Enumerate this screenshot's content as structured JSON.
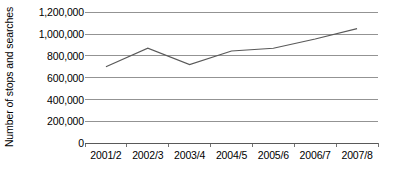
{
  "chart_data": {
    "type": "line",
    "title": "",
    "subtitle": "",
    "xlabel": "",
    "ylabel": "Number of stops and searches",
    "categories": [
      "2001/2",
      "2002/3",
      "2003/4",
      "2004/5",
      "2005/6",
      "2006/7",
      "2007/8"
    ],
    "series": [
      {
        "name": "Number of stops and searches",
        "values": [
          700000,
          870000,
          720000,
          845000,
          870000,
          955000,
          1050000
        ]
      }
    ],
    "ylim": [
      0,
      1200000
    ],
    "y_ticks": [
      0,
      200000,
      400000,
      600000,
      800000,
      1000000,
      1200000
    ],
    "y_tick_labels": [
      "0",
      "200,000",
      "400,000",
      "600,000",
      "800,000",
      "1,000,000",
      "1,200,000"
    ],
    "grid": true,
    "grid_axis": "y",
    "legend": false,
    "legend_position": "none",
    "markers": false,
    "line_color": "#595959",
    "grid_color": "#808080",
    "axis_color": "#595959",
    "text_color": "#000000",
    "background_color": "#ffffff"
  },
  "axes": {
    "y_title": "Number of stops and searches",
    "y_labels": [
      "1,200,000",
      "1,000,000",
      "800,000",
      "600,000",
      "400,000",
      "200,000",
      "0"
    ],
    "x_labels": [
      "2001/2",
      "2002/3",
      "2003/4",
      "2004/5",
      "2005/6",
      "2006/7",
      "2007/8"
    ]
  }
}
